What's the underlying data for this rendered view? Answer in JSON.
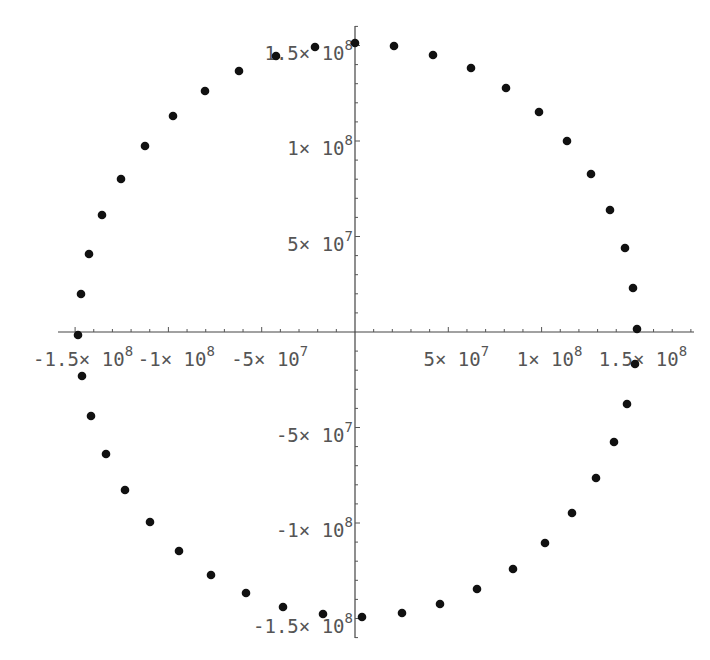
{
  "chart_data": {
    "type": "scatter",
    "title": "",
    "xlabel": "",
    "ylabel": "",
    "xlim": [
      -160000000.0,
      180000000.0
    ],
    "ylim": [
      -155000000.0,
      160000000.0
    ],
    "grid": false,
    "legend": null,
    "x_ticks": [
      {
        "value": -150000000.0,
        "mantissa": "-1.5",
        "exp": "8"
      },
      {
        "value": -100000000.0,
        "mantissa": "-1",
        "exp": "8"
      },
      {
        "value": -50000000.0,
        "mantissa": "-5",
        "exp": "7"
      },
      {
        "value": 50000000.0,
        "mantissa": "5",
        "exp": "7"
      },
      {
        "value": 100000000.0,
        "mantissa": "1",
        "exp": "8"
      },
      {
        "value": 150000000.0,
        "mantissa": "1.5",
        "exp": "8"
      }
    ],
    "y_ticks": [
      {
        "value": 150000000.0,
        "mantissa": "1.5",
        "exp": "8"
      },
      {
        "value": 100000000.0,
        "mantissa": "1",
        "exp": "8"
      },
      {
        "value": 50000000.0,
        "mantissa": "5",
        "exp": "7"
      },
      {
        "value": -50000000.0,
        "mantissa": "-5",
        "exp": "7"
      },
      {
        "value": -100000000.0,
        "mantissa": "-1",
        "exp": "8"
      },
      {
        "value": -150000000.0,
        "mantissa": "-1.5",
        "exp": "8"
      }
    ],
    "series": [
      {
        "name": "orbit",
        "marker": "filled-circle",
        "color": "#111111",
        "points_px": [
          [
            355,
            43
          ],
          [
            394,
            46
          ],
          [
            433,
            55
          ],
          [
            471,
            68
          ],
          [
            506,
            88
          ],
          [
            539,
            112
          ],
          [
            567,
            141
          ],
          [
            591,
            174
          ],
          [
            610,
            210
          ],
          [
            625,
            248
          ],
          [
            633,
            288
          ],
          [
            637,
            329
          ],
          [
            635,
            364
          ],
          [
            627,
            404
          ],
          [
            614,
            442
          ],
          [
            596,
            478
          ],
          [
            572,
            513
          ],
          [
            545,
            543
          ],
          [
            513,
            569
          ],
          [
            477,
            589
          ],
          [
            440,
            604
          ],
          [
            402,
            613
          ],
          [
            362,
            617
          ],
          [
            323,
            614
          ],
          [
            283,
            607
          ],
          [
            246,
            593
          ],
          [
            211,
            575
          ],
          [
            179,
            551
          ],
          [
            150,
            522
          ],
          [
            125,
            490
          ],
          [
            106,
            454
          ],
          [
            91,
            416
          ],
          [
            82,
            376
          ],
          [
            78,
            335
          ],
          [
            81,
            294
          ],
          [
            89,
            254
          ],
          [
            102,
            215
          ],
          [
            121,
            179
          ],
          [
            145,
            146
          ],
          [
            173,
            116
          ],
          [
            205,
            91
          ],
          [
            239,
            71
          ],
          [
            276,
            56
          ],
          [
            315,
            47
          ]
        ]
      }
    ]
  },
  "axes": {
    "origin_px": [
      355,
      332
    ],
    "x_axis_px": [
      58,
      694
    ],
    "y_axis_px": [
      26,
      638
    ]
  }
}
